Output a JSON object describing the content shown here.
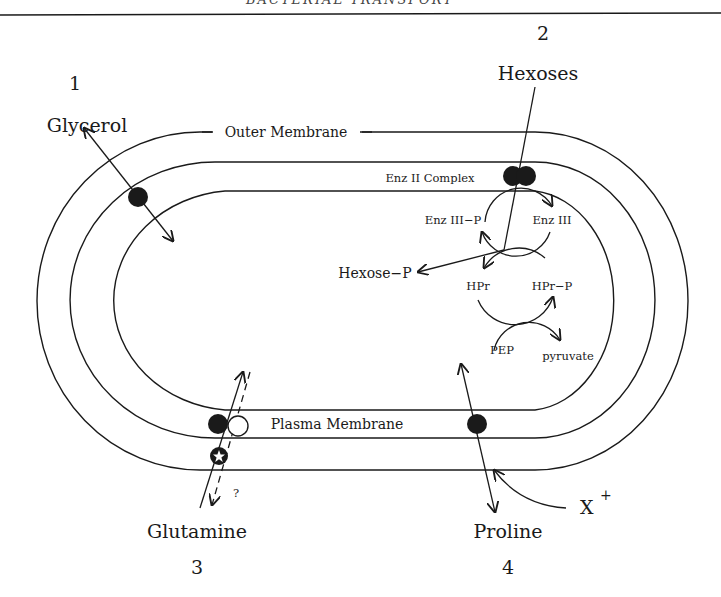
{
  "header": {
    "running_title": "BACTERIAL TRANSPORT"
  },
  "membranes": {
    "outer_label": "Outer Membrane",
    "enz_ii_label": "Enz II Complex",
    "plasma_label": "Plasma Membrane"
  },
  "systems": [
    {
      "number": "1",
      "substrate": "Glycerol"
    },
    {
      "number": "2",
      "substrate": "Hexoses"
    },
    {
      "number": "3",
      "substrate": "Proline"
    },
    {
      "number": "4",
      "substrate": "Glutamine"
    }
  ],
  "pts": {
    "enz_iii_p": "Enz III−P",
    "enz_iii": "Enz III",
    "hexose_p": "Hexose−P",
    "hpr": "HPr",
    "hpr_p": "HPr−P",
    "pyruvate": "pyruvate",
    "pep": "PEP"
  },
  "proline": {
    "cation": "X",
    "cation_charge": "+"
  },
  "glutamine": {
    "question_mark": "?"
  },
  "colors": {
    "ink": "#1a1a1a",
    "background": "#ffffff"
  }
}
